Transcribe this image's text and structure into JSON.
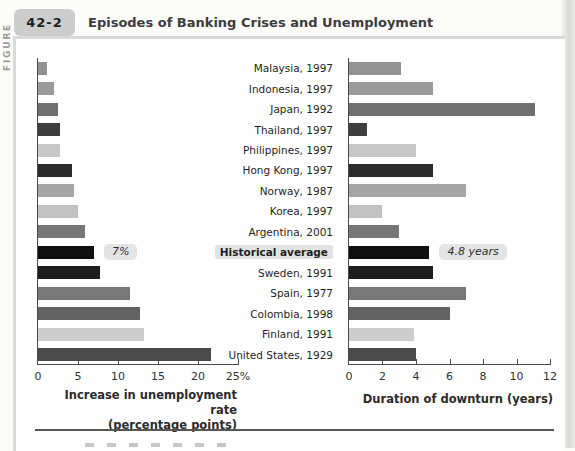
{
  "header": {
    "figure_label": "FIGURE",
    "figure_number": "42-2",
    "title": "Episodes of Banking Crises and Unemployment"
  },
  "chart_data": {
    "type": "bar",
    "orientation": "horizontal",
    "grid": false,
    "legend": false,
    "categories": [
      "Malaysia, 1997",
      "Indonesia, 1997",
      "Japan, 1992",
      "Thailand, 1997",
      "Philippines, 1997",
      "Hong Kong, 1997",
      "Norway, 1987",
      "Korea, 1997",
      "Argentina, 2001",
      "Historical average",
      "Sweden, 1991",
      "Spain, 1977",
      "Colombia, 1998",
      "Finland, 1991",
      "United States, 1929"
    ],
    "highlight_index": 9,
    "bar_colors": [
      "#929292",
      "#9a9a9a",
      "#6f6f6f",
      "#3e3e3e",
      "#c7c7c7",
      "#2b2b2b",
      "#a5a5a5",
      "#c2c2c2",
      "#767676",
      "#0f0f0f",
      "#1d1d1d",
      "#787878",
      "#626262",
      "#cdcdcd",
      "#4b4b4b"
    ],
    "series": [
      {
        "name": "Increase in unemployment rate (percentage points)",
        "values": [
          1.1,
          2.0,
          2.5,
          2.7,
          2.8,
          4.3,
          4.5,
          5.0,
          5.9,
          7.0,
          7.8,
          11.5,
          12.8,
          13.3,
          21.6
        ],
        "xlim": [
          0,
          25
        ],
        "ticks": [
          0,
          5,
          10,
          15,
          20,
          25
        ],
        "tick_labels": [
          "0",
          "5",
          "10",
          "15",
          "20",
          "25%"
        ],
        "xlabel_line1": "Increase in unemployment rate",
        "xlabel_line2": "(percentage points)",
        "annotation": {
          "row_index": 9,
          "text": "7%"
        }
      },
      {
        "name": "Duration of downturn (years)",
        "values": [
          3.1,
          5.0,
          11.1,
          1.1,
          4.0,
          5.0,
          7.0,
          2.0,
          3.0,
          4.8,
          5.0,
          7.0,
          6.0,
          3.9,
          4.0
        ],
        "xlim": [
          0,
          12
        ],
        "ticks": [
          0,
          2,
          4,
          6,
          8,
          10,
          12
        ],
        "tick_labels": [
          "0",
          "2",
          "4",
          "6",
          "8",
          "10",
          "12"
        ],
        "xlabel": "Duration of downturn (years)",
        "annotation": {
          "row_index": 9,
          "text": "4.8 years"
        }
      }
    ]
  },
  "colors": {
    "axis": "#4a4a4a",
    "annotation_bg": "#e4e4e4",
    "highlight_bg": "#e3e3e3",
    "tab_bg": "#cdcdcd",
    "bottom_rule": "#565656"
  }
}
